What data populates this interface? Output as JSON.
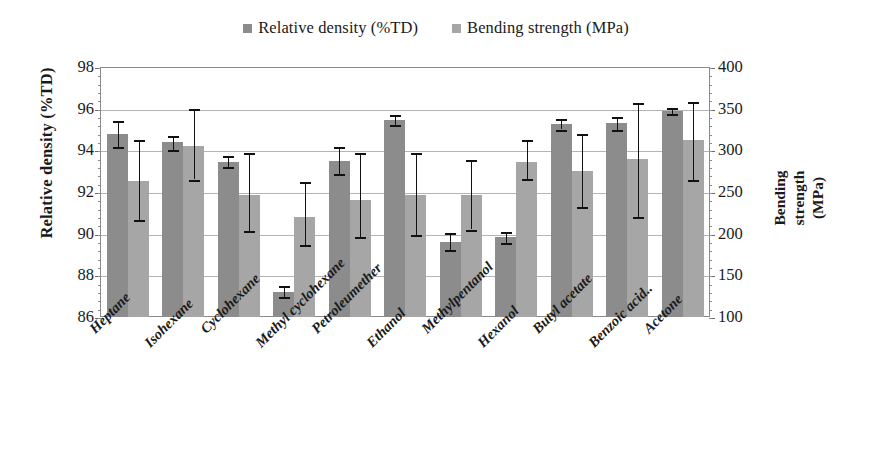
{
  "legend": {
    "items": [
      {
        "label": "Relative density (%TD)",
        "color": "#8c8c8c",
        "icon": "square-marker-icon"
      },
      {
        "label": "Bending strength (MPa)",
        "color": "#a6a6a6",
        "icon": "square-marker-icon"
      }
    ]
  },
  "axes": {
    "left_title": "Relative density (%TD)",
    "right_title_lines": [
      "Bending",
      "strength",
      "(MPa)"
    ],
    "left_ticks": [
      "86",
      "88",
      "90",
      "92",
      "94",
      "96",
      "98"
    ],
    "right_ticks": [
      "100",
      "150",
      "200",
      "250",
      "300",
      "350",
      "400"
    ]
  },
  "chart_data": {
    "type": "bar",
    "title": "",
    "xlabel": "",
    "ylabel": "Relative density (%TD)",
    "y2label": "Bending strength (MPa)",
    "ylim": [
      86,
      98
    ],
    "y2lim": [
      100,
      400
    ],
    "ytick_step": 2,
    "y2tick_step": 50,
    "grid": true,
    "legend_position": "top-center",
    "categories": [
      "Heptane",
      "Isohexane",
      "Cyclohexane",
      "Methyl cyclohexane",
      "Petroleumether",
      "Ethanol",
      "Methylpentanol",
      "Hexanol",
      "Butyl acetate",
      "Benzoic acid..",
      "Acetone"
    ],
    "series": [
      {
        "name": "Relative density (%TD)",
        "axis": "left",
        "color": "#8c8c8c",
        "values": [
          94.8,
          94.4,
          93.45,
          87.2,
          93.5,
          95.45,
          89.6,
          89.85,
          95.25,
          95.3,
          95.9
        ],
        "err_low": [
          94.15,
          94.0,
          93.2,
          86.95,
          92.85,
          95.2,
          89.2,
          89.55,
          95.0,
          95.0,
          95.75
        ],
        "err_high": [
          95.4,
          94.7,
          93.75,
          87.5,
          94.15,
          95.7,
          90.05,
          90.1,
          95.5,
          95.6,
          96.05
        ]
      },
      {
        "name": "Bending strength (MPa)",
        "axis": "right",
        "color": "#a6a6a6",
        "values_td_scale": [
          92.5,
          94.2,
          91.85,
          90.8,
          91.6,
          91.85,
          91.85,
          93.45,
          93.0,
          93.6,
          94.5
        ],
        "values": [
          263,
          305,
          246,
          220,
          240,
          246,
          246,
          286,
          275,
          290,
          313
        ],
        "err_low": [
          216,
          265,
          203,
          186,
          196,
          198,
          205,
          266,
          232,
          220,
          265
        ],
        "err_high": [
          313,
          350,
          297,
          262,
          297,
          297,
          288,
          312,
          320,
          357,
          358
        ]
      }
    ]
  }
}
